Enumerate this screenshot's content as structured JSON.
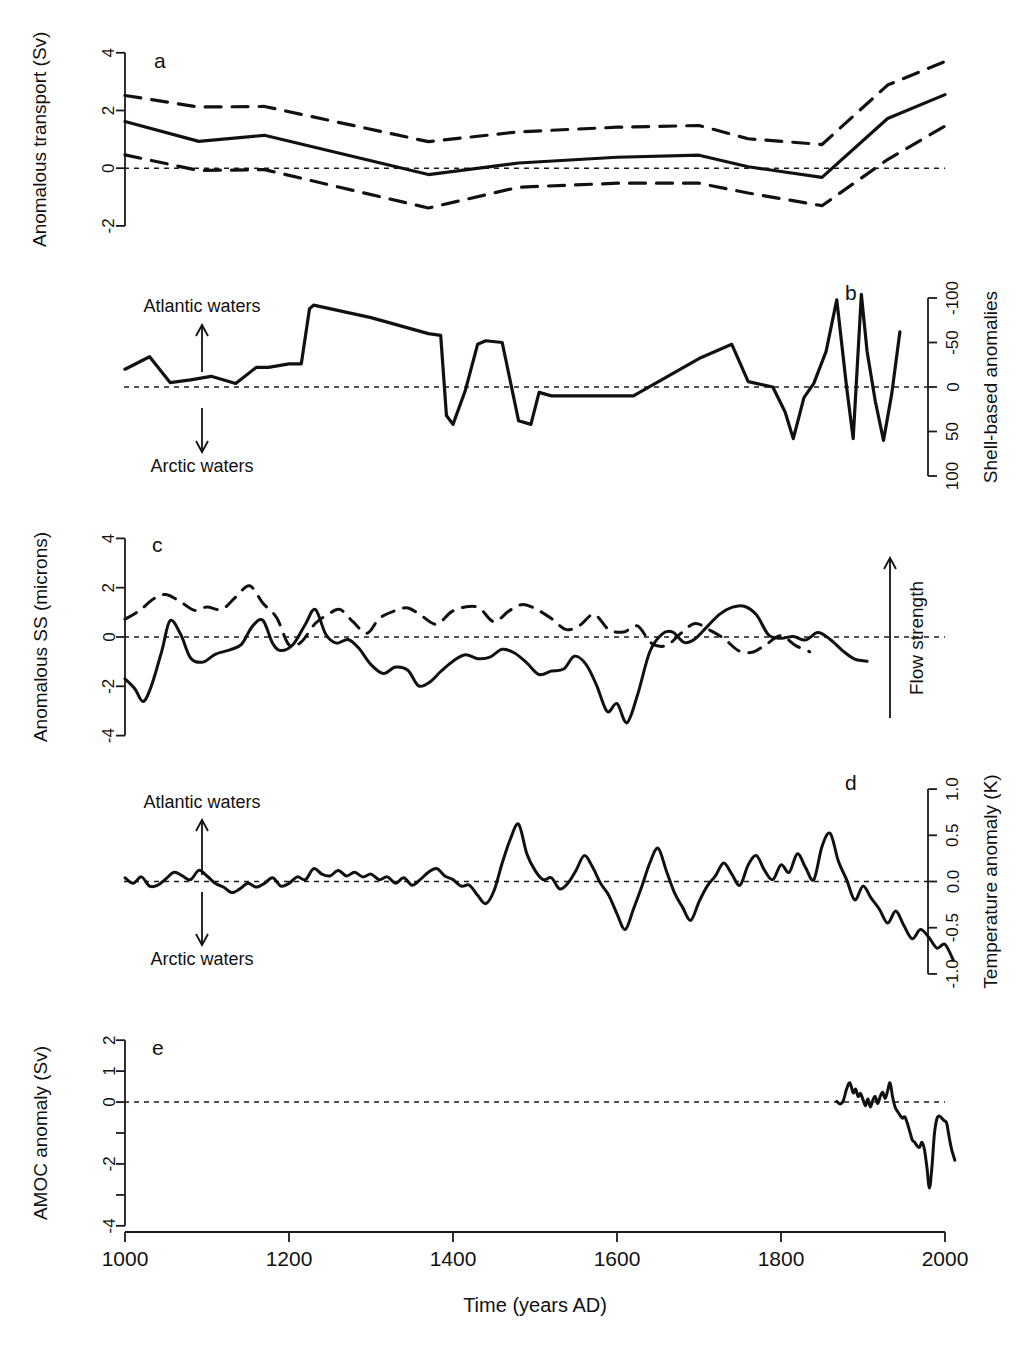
{
  "figure": {
    "xaxis": {
      "title": "Time (years AD)",
      "ticks": [
        "1000",
        "1200",
        "1400",
        "1600",
        "1800",
        "2000"
      ],
      "tick_values": [
        1000,
        1200,
        1400,
        1600,
        1800,
        2000
      ],
      "range": [
        1000,
        2020
      ]
    },
    "panels": [
      {
        "id": "a",
        "label": "a",
        "left_axis_title": "Anomalous transport (Sv)",
        "left_ticks": [
          "-2",
          "0",
          "2",
          "4"
        ],
        "left_tick_values": [
          -2,
          0,
          2,
          4
        ],
        "ylim": [
          -2.35,
          4.2
        ],
        "zero_line": 0
      },
      {
        "id": "b",
        "label": "b",
        "right_axis_title": "Shell-based anomalies",
        "right_ticks": [
          "-100",
          "-50",
          "0",
          "50",
          "100"
        ],
        "right_tick_values": [
          -100,
          -50,
          0,
          50,
          100
        ],
        "ylim": [
          -118,
          118
        ],
        "inverted": true,
        "zero_line": 0,
        "annotations": {
          "up_label": "Atlantic waters",
          "down_label": "Arctic waters"
        }
      },
      {
        "id": "c",
        "label": "c",
        "left_axis_title": "Anomalous SS (microns)",
        "left_ticks": [
          "-4",
          "-2",
          "0",
          "2",
          "4"
        ],
        "left_tick_values": [
          -4,
          -2,
          0,
          2,
          4
        ],
        "ylim": [
          -4.3,
          4.3
        ],
        "zero_line": 0,
        "annotations": {
          "arrow_label": "Flow strength"
        }
      },
      {
        "id": "d",
        "label": "d",
        "right_axis_title": "Temperature anomaly (K)",
        "right_ticks": [
          "1.0",
          "0.5",
          "0.0",
          "-0.5",
          "-1.0"
        ],
        "right_tick_values": [
          1.0,
          0.5,
          0.0,
          -0.5,
          -1.0
        ],
        "ylim": [
          -1.12,
          1.12
        ],
        "zero_line": 0,
        "annotations": {
          "up_label": "Atlantic waters",
          "down_label": "Arctic waters"
        }
      },
      {
        "id": "e",
        "label": "e",
        "left_axis_title": "AMOC anomaly (Sv)",
        "left_ticks": [
          "2",
          "1",
          "0",
          "",
          "-2",
          "",
          "-4"
        ],
        "left_tick_values": [
          2,
          1,
          0,
          -1,
          -2,
          -3,
          -4
        ],
        "ylim": [
          -4.2,
          2.2
        ],
        "zero_line": 0
      }
    ]
  },
  "chart_data": [
    {
      "type": "line",
      "panel": "a",
      "title": "",
      "xlabel": "Time (years AD)",
      "ylabel": "Anomalous transport (Sv)",
      "xlim": [
        1000,
        2020
      ],
      "ylim": [
        -2.35,
        4.2
      ],
      "grid": false,
      "legend": "none",
      "series": [
        {
          "name": "mean",
          "style": "solid",
          "x": [
            1000,
            1090,
            1170,
            1370,
            1480,
            1600,
            1700,
            1760,
            1850,
            1930,
            2000
          ],
          "values": [
            1.62,
            0.93,
            1.14,
            -0.22,
            0.18,
            0.38,
            0.45,
            0.05,
            -0.32,
            1.72,
            2.55
          ]
        },
        {
          "name": "upper-bound",
          "style": "dashed",
          "x": [
            1000,
            1090,
            1170,
            1370,
            1480,
            1600,
            1700,
            1760,
            1850,
            1930,
            2000
          ],
          "values": [
            2.52,
            2.12,
            2.14,
            0.92,
            1.26,
            1.42,
            1.48,
            1.02,
            0.82,
            2.88,
            3.7
          ]
        },
        {
          "name": "lower-bound",
          "style": "dashed",
          "x": [
            1000,
            1090,
            1170,
            1370,
            1480,
            1600,
            1700,
            1760,
            1850,
            1930,
            2000
          ],
          "values": [
            0.46,
            -0.08,
            -0.05,
            -1.38,
            -0.66,
            -0.52,
            -0.52,
            -0.86,
            -1.3,
            0.3,
            1.46
          ]
        }
      ]
    },
    {
      "type": "line",
      "panel": "b",
      "title": "",
      "xlabel": "Time (years AD)",
      "ylabel": "Shell-based anomalies",
      "xlim": [
        1000,
        2020
      ],
      "ylim": [
        -118,
        118
      ],
      "yaxis_inverted": true,
      "grid": false,
      "legend": "none",
      "series": [
        {
          "name": "shell-based-anomaly",
          "style": "solid",
          "x": [
            1000,
            1030,
            1055,
            1080,
            1105,
            1135,
            1160,
            1175,
            1200,
            1215,
            1225,
            1230,
            1300,
            1370,
            1385,
            1392,
            1400,
            1415,
            1430,
            1440,
            1460,
            1480,
            1495,
            1505,
            1520,
            1560,
            1620,
            1700,
            1740,
            1760,
            1790,
            1805,
            1815,
            1828,
            1840,
            1855,
            1868,
            1880,
            1888,
            1898,
            1905,
            1915,
            1925,
            1935,
            1945
          ],
          "values": [
            -20,
            -34,
            -5,
            -8,
            -12,
            -4,
            -22,
            -22,
            -26,
            -26,
            -88,
            -92,
            -78,
            -60,
            -58,
            32,
            42,
            4,
            -48,
            -52,
            -50,
            38,
            42,
            6,
            10,
            10,
            10,
            -32,
            -48,
            -6,
            0,
            28,
            58,
            12,
            -4,
            -40,
            -98,
            0,
            58,
            -104,
            -40,
            16,
            60,
            8,
            -62
          ]
        }
      ]
    },
    {
      "type": "line",
      "panel": "c",
      "title": "",
      "xlabel": "Time (years AD)",
      "ylabel": "Anomalous SS (microns)",
      "xlim": [
        1000,
        2020
      ],
      "ylim": [
        -4.3,
        4.3
      ],
      "grid": false,
      "legend": "none",
      "series": [
        {
          "name": "record-1-solid",
          "style": "solid",
          "x": [
            1000,
            1012,
            1022,
            1032,
            1045,
            1055,
            1068,
            1080,
            1095,
            1110,
            1128,
            1142,
            1155,
            1168,
            1180,
            1190,
            1205,
            1220,
            1232,
            1245,
            1258,
            1272,
            1285,
            1300,
            1315,
            1330,
            1345,
            1358,
            1372,
            1385,
            1400,
            1415,
            1430,
            1445,
            1460,
            1475,
            1490,
            1505,
            1520,
            1535,
            1548,
            1562,
            1575,
            1588,
            1600,
            1612,
            1625,
            1640,
            1655,
            1668,
            1682,
            1695,
            1710,
            1725,
            1740,
            1755,
            1770,
            1785,
            1800,
            1815,
            1830,
            1845,
            1860,
            1875,
            1890,
            1905
          ],
          "values": [
            -1.7,
            -2.1,
            -2.62,
            -2.0,
            -0.55,
            0.66,
            0.1,
            -0.85,
            -1.02,
            -0.7,
            -0.52,
            -0.3,
            0.42,
            0.68,
            -0.25,
            -0.55,
            -0.3,
            0.52,
            1.12,
            0.1,
            -0.25,
            -0.1,
            -0.45,
            -1.12,
            -1.48,
            -1.22,
            -1.35,
            -1.98,
            -1.82,
            -1.4,
            -0.98,
            -0.72,
            -0.88,
            -0.82,
            -0.5,
            -0.65,
            -1.05,
            -1.52,
            -1.38,
            -1.3,
            -0.78,
            -1.1,
            -1.95,
            -3.02,
            -2.7,
            -3.48,
            -2.35,
            -0.6,
            0.12,
            0.2,
            -0.22,
            -0.08,
            0.42,
            0.92,
            1.2,
            1.25,
            0.9,
            0.08,
            -0.05,
            0.02,
            -0.12,
            0.18,
            -0.1,
            -0.55,
            -0.9,
            -0.98
          ]
        },
        {
          "name": "record-2-dashed",
          "style": "dashed",
          "x": [
            1000,
            1018,
            1035,
            1050,
            1068,
            1085,
            1100,
            1118,
            1135,
            1152,
            1168,
            1185,
            1200,
            1215,
            1232,
            1248,
            1262,
            1278,
            1295,
            1310,
            1328,
            1345,
            1362,
            1380,
            1398,
            1415,
            1432,
            1450,
            1468,
            1485,
            1502,
            1520,
            1538,
            1555,
            1572,
            1590,
            1608,
            1625,
            1642,
            1660,
            1678,
            1695,
            1712,
            1730,
            1748,
            1765,
            1782,
            1800,
            1818,
            1835
          ],
          "values": [
            0.72,
            1.08,
            1.55,
            1.72,
            1.42,
            1.08,
            1.22,
            1.12,
            1.62,
            2.08,
            1.38,
            0.78,
            -0.32,
            -0.2,
            0.55,
            0.92,
            1.12,
            0.62,
            0.15,
            0.75,
            1.05,
            1.18,
            0.85,
            0.52,
            1.02,
            1.22,
            1.18,
            0.62,
            1.05,
            1.32,
            1.12,
            0.75,
            0.3,
            0.48,
            0.92,
            0.3,
            0.2,
            0.45,
            -0.25,
            -0.35,
            0.15,
            0.55,
            0.3,
            -0.05,
            -0.55,
            -0.62,
            -0.3,
            0.05,
            -0.35,
            -0.6
          ]
        }
      ]
    },
    {
      "type": "line",
      "panel": "d",
      "title": "",
      "xlabel": "Time (years AD)",
      "ylabel": "Temperature anomaly (K)",
      "xlim": [
        1000,
        2020
      ],
      "ylim": [
        -1.12,
        1.12
      ],
      "grid": false,
      "legend": "none",
      "series": [
        {
          "name": "temperature-anomaly",
          "style": "solid",
          "x": [
            1000,
            1010,
            1020,
            1030,
            1040,
            1050,
            1060,
            1070,
            1080,
            1090,
            1100,
            1110,
            1120,
            1130,
            1140,
            1150,
            1160,
            1170,
            1180,
            1190,
            1200,
            1210,
            1220,
            1230,
            1240,
            1250,
            1260,
            1270,
            1280,
            1290,
            1300,
            1310,
            1320,
            1330,
            1340,
            1350,
            1360,
            1370,
            1380,
            1390,
            1400,
            1410,
            1420,
            1430,
            1440,
            1450,
            1460,
            1470,
            1480,
            1490,
            1500,
            1510,
            1520,
            1530,
            1540,
            1550,
            1560,
            1570,
            1580,
            1590,
            1600,
            1610,
            1620,
            1630,
            1640,
            1650,
            1660,
            1670,
            1680,
            1690,
            1700,
            1710,
            1720,
            1730,
            1740,
            1750,
            1760,
            1770,
            1780,
            1790,
            1800,
            1810,
            1820,
            1830,
            1840,
            1850,
            1860,
            1870,
            1880,
            1890,
            1900,
            1910,
            1920,
            1930,
            1940,
            1950,
            1960,
            1970,
            1980,
            1990,
            2000,
            2010
          ],
          "values": [
            0.04,
            -0.02,
            0.05,
            -0.05,
            -0.04,
            0.03,
            0.1,
            0.06,
            0.02,
            0.12,
            0.06,
            -0.02,
            -0.06,
            -0.12,
            -0.08,
            -0.02,
            -0.06,
            -0.02,
            0.04,
            -0.05,
            -0.02,
            0.05,
            0.02,
            0.14,
            0.08,
            0.06,
            0.12,
            0.06,
            0.1,
            0.05,
            0.08,
            0.02,
            0.05,
            -0.02,
            0.04,
            -0.04,
            0.02,
            0.1,
            0.14,
            0.06,
            0.02,
            -0.05,
            -0.04,
            -0.15,
            -0.24,
            -0.1,
            0.2,
            0.46,
            0.62,
            0.3,
            0.12,
            0.02,
            0.04,
            -0.08,
            -0.02,
            0.12,
            0.28,
            0.16,
            -0.02,
            -0.15,
            -0.35,
            -0.52,
            -0.3,
            -0.06,
            0.2,
            0.36,
            0.12,
            -0.12,
            -0.28,
            -0.42,
            -0.22,
            -0.05,
            0.06,
            0.2,
            0.08,
            -0.04,
            0.18,
            0.28,
            0.12,
            0.02,
            0.18,
            0.1,
            0.3,
            0.15,
            0.02,
            0.38,
            0.52,
            0.22,
            0.02,
            -0.2,
            -0.05,
            -0.18,
            -0.3,
            -0.45,
            -0.32,
            -0.48,
            -0.62,
            -0.52,
            -0.6,
            -0.72,
            -0.68,
            -0.85,
            -0.95
          ]
        }
      ]
    },
    {
      "type": "line",
      "panel": "e",
      "title": "",
      "xlabel": "Time (years AD)",
      "ylabel": "AMOC anomaly (Sv)",
      "xlim": [
        1000,
        2020
      ],
      "ylim": [
        -4.2,
        2.2
      ],
      "grid": false,
      "legend": "none",
      "series": [
        {
          "name": "amoc-anomaly",
          "style": "solid",
          "x": [
            1868,
            1872,
            1876,
            1880,
            1884,
            1888,
            1891,
            1894,
            1897,
            1900,
            1903,
            1906,
            1909,
            1912,
            1915,
            1918,
            1921,
            1924,
            1927,
            1930,
            1933,
            1936,
            1939,
            1942,
            1945,
            1948,
            1951,
            1954,
            1957,
            1960,
            1963,
            1966,
            1969,
            1972,
            1975,
            1978,
            1981,
            1984,
            1987,
            1990,
            1993,
            1996,
            1999,
            2002,
            2005,
            2008,
            2012
          ],
          "values": [
            0.02,
            -0.06,
            0.05,
            0.42,
            0.62,
            0.3,
            0.42,
            0.18,
            0.28,
            0.08,
            -0.12,
            0.1,
            -0.16,
            0.06,
            0.18,
            -0.05,
            0.18,
            0.32,
            0.12,
            0.36,
            0.62,
            0.18,
            -0.15,
            -0.3,
            -0.42,
            -0.52,
            -0.48,
            -0.68,
            -0.95,
            -1.22,
            -1.3,
            -1.42,
            -1.46,
            -1.3,
            -1.55,
            -2.12,
            -2.78,
            -2.12,
            -1.05,
            -0.55,
            -0.45,
            -0.52,
            -0.6,
            -0.68,
            -1.12,
            -1.52,
            -1.88
          ]
        }
      ]
    }
  ]
}
